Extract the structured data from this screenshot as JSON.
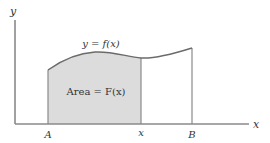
{
  "diagram": {
    "axes": {
      "y_label": "y",
      "x_label": "x"
    },
    "curve_label": "y = f(x)",
    "area_label": "Area = F(x)",
    "ticks": [
      {
        "label": "A"
      },
      {
        "label": "x"
      },
      {
        "label": "B"
      }
    ],
    "colors": {
      "axis": "#8a8a8a",
      "curve": "#6b6b6b",
      "shade": "#dcdcdc",
      "text": "#333333",
      "background": "#ffffff"
    }
  }
}
